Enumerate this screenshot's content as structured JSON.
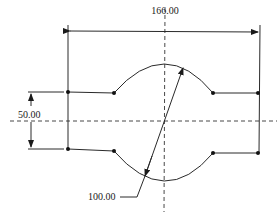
{
  "drawing": {
    "type": "engineering-dimension-sketch",
    "dimensions": {
      "width_label": "166.00",
      "height_label": "50.00",
      "diameter_label": "100.00"
    },
    "colors": {
      "line": "#2a2a2a",
      "background": "#ffffff"
    }
  }
}
